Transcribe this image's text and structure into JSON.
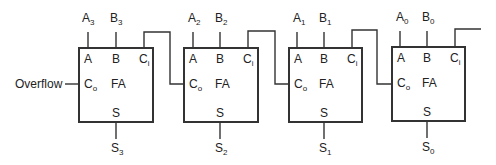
{
  "diagram": {
    "overflow_label": "Overflow",
    "block_label": "FA",
    "port_labels": {
      "a": "A",
      "b": "B",
      "ci": "C",
      "ci_sub": "i",
      "co": "C",
      "co_sub": "o",
      "s": "S"
    },
    "stages": [
      {
        "index": 3,
        "a_in": "A",
        "a_sub": "3",
        "b_in": "B",
        "b_sub": "3",
        "s_out": "S",
        "s_sub": "3",
        "x": 79
      },
      {
        "index": 2,
        "a_in": "A",
        "a_sub": "2",
        "b_in": "B",
        "b_sub": "2",
        "s_out": "S",
        "s_sub": "2",
        "x": 184
      },
      {
        "index": 1,
        "a_in": "A",
        "a_sub": "1",
        "b_in": "B",
        "b_sub": "1",
        "s_out": "S",
        "s_sub": "1",
        "x": 289
      },
      {
        "index": 0,
        "a_in": "A",
        "a_sub": "0",
        "b_in": "B",
        "b_sub": "0",
        "s_out": "S",
        "s_sub": "0",
        "x": 392
      }
    ],
    "line_color": "#333333"
  }
}
